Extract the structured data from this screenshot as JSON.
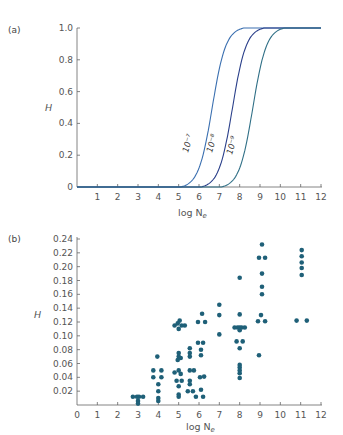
{
  "chart_data": [
    {
      "panel": "(a)",
      "type": "line",
      "xlabel": "log N_e",
      "ylabel": "H",
      "xlim": [
        0,
        12
      ],
      "ylim": [
        0,
        1.0
      ],
      "xticks": [
        "1",
        "2",
        "3",
        "4",
        "5",
        "6",
        "7",
        "8",
        "9",
        "10",
        "11",
        "12"
      ],
      "yticks": [
        "0",
        "0.2",
        "0.4",
        "0.6",
        "0.8",
        "1.0"
      ],
      "grid": false,
      "series": [
        {
          "name": "10⁻⁷",
          "midpoint": 6.9,
          "color": "#3a6fb0",
          "x": [
            0,
            4,
            4.5,
            5,
            5.5,
            6,
            6.5,
            7,
            7.5,
            8,
            8.5,
            9,
            9.5,
            10,
            12
          ],
          "y": [
            0,
            0,
            0.01,
            0.04,
            0.12,
            0.35,
            0.62,
            0.85,
            0.95,
            0.99,
            1.0,
            1.0,
            1.0,
            1.0,
            1.0
          ]
        },
        {
          "name": "10⁻⁸",
          "midpoint": 7.9,
          "color": "#2a3f8a",
          "x": [
            0,
            5,
            5.5,
            6,
            6.5,
            7,
            7.5,
            8,
            8.5,
            9,
            9.5,
            10,
            10.5,
            12
          ],
          "y": [
            0,
            0,
            0.01,
            0.05,
            0.13,
            0.33,
            0.6,
            0.82,
            0.94,
            0.99,
            1.0,
            1.0,
            1.0,
            1.0
          ]
        },
        {
          "name": "10⁻⁹",
          "midpoint": 8.9,
          "color": "#2f6f86",
          "x": [
            0,
            6,
            6.5,
            7,
            7.5,
            8,
            8.5,
            9,
            9.5,
            10,
            10.5,
            11,
            12
          ],
          "y": [
            0,
            0,
            0.01,
            0.05,
            0.14,
            0.35,
            0.62,
            0.84,
            0.95,
            0.99,
            1.0,
            1.0,
            1.0
          ]
        }
      ],
      "annotations": [
        "10⁻⁷",
        "10⁻⁸",
        "10⁻⁹"
      ]
    },
    {
      "panel": "(b)",
      "type": "scatter",
      "xlabel": "log N_e",
      "ylabel": "H",
      "xlim": [
        0,
        12
      ],
      "ylim": [
        0,
        0.24
      ],
      "xticks": [
        "0",
        "1",
        "2",
        "3",
        "4",
        "5",
        "6",
        "7",
        "8",
        "9",
        "10",
        "11",
        "12"
      ],
      "yticks": [
        "0.02",
        "0.04",
        "0.06",
        "0.08",
        "0.10",
        "0.12",
        "0.14",
        "0.16",
        "0.18",
        "0.20",
        "0.22",
        "0.24"
      ],
      "grid": false,
      "color": "#1f6078",
      "points": [
        [
          2.75,
          0.012
        ],
        [
          2.95,
          0.012
        ],
        [
          3.05,
          0.012
        ],
        [
          3.25,
          0.012
        ],
        [
          3.0,
          0.006
        ],
        [
          3.0,
          0.002
        ],
        [
          3.75,
          0.05
        ],
        [
          4.15,
          0.05
        ],
        [
          3.75,
          0.04
        ],
        [
          4.15,
          0.04
        ],
        [
          3.95,
          0.07
        ],
        [
          4.0,
          0.03
        ],
        [
          4.0,
          0.02
        ],
        [
          4.0,
          0.01
        ],
        [
          4.0,
          0.006
        ],
        [
          4.8,
          0.115
        ],
        [
          4.95,
          0.118
        ],
        [
          5.05,
          0.122
        ],
        [
          5.15,
          0.115
        ],
        [
          5.3,
          0.115
        ],
        [
          5.0,
          0.11
        ],
        [
          5.0,
          0.075
        ],
        [
          5.0,
          0.07
        ],
        [
          5.1,
          0.068
        ],
        [
          4.95,
          0.065
        ],
        [
          5.0,
          0.05
        ],
        [
          5.1,
          0.045
        ],
        [
          4.8,
          0.047
        ],
        [
          4.9,
          0.035
        ],
        [
          5.15,
          0.035
        ],
        [
          5.0,
          0.027
        ],
        [
          5.0,
          0.015
        ],
        [
          5.0,
          0.012
        ],
        [
          5.55,
          0.082
        ],
        [
          5.55,
          0.075
        ],
        [
          5.55,
          0.07
        ],
        [
          5.55,
          0.05
        ],
        [
          5.75,
          0.05
        ],
        [
          5.55,
          0.035
        ],
        [
          5.55,
          0.03
        ],
        [
          5.45,
          0.02
        ],
        [
          5.7,
          0.02
        ],
        [
          5.85,
          0.012
        ],
        [
          5.95,
          0.12
        ],
        [
          6.3,
          0.12
        ],
        [
          6.15,
          0.132
        ],
        [
          5.95,
          0.09
        ],
        [
          6.2,
          0.09
        ],
        [
          6.1,
          0.08
        ],
        [
          6.1,
          0.072
        ],
        [
          6.05,
          0.04
        ],
        [
          6.25,
          0.041
        ],
        [
          6.1,
          0.022
        ],
        [
          6.2,
          0.012
        ],
        [
          7.0,
          0.145
        ],
        [
          7.0,
          0.13
        ],
        [
          7.0,
          0.102
        ],
        [
          8.0,
          0.184
        ],
        [
          8.0,
          0.131
        ],
        [
          7.75,
          0.112
        ],
        [
          7.9,
          0.112
        ],
        [
          8.0,
          0.112
        ],
        [
          8.1,
          0.112
        ],
        [
          8.25,
          0.112
        ],
        [
          8.0,
          0.108
        ],
        [
          7.85,
          0.092
        ],
        [
          8.15,
          0.092
        ],
        [
          8.0,
          0.082
        ],
        [
          8.0,
          0.058
        ],
        [
          8.0,
          0.054
        ],
        [
          8.0,
          0.05
        ],
        [
          8.0,
          0.046
        ],
        [
          8.0,
          0.039
        ],
        [
          9.1,
          0.232
        ],
        [
          8.95,
          0.213
        ],
        [
          9.25,
          0.213
        ],
        [
          9.1,
          0.19
        ],
        [
          9.1,
          0.171
        ],
        [
          9.1,
          0.16
        ],
        [
          9.05,
          0.13
        ],
        [
          8.9,
          0.121
        ],
        [
          9.25,
          0.121
        ],
        [
          8.95,
          0.072
        ],
        [
          11.05,
          0.224
        ],
        [
          11.05,
          0.215
        ],
        [
          11.05,
          0.206
        ],
        [
          11.05,
          0.198
        ],
        [
          11.05,
          0.188
        ],
        [
          10.8,
          0.122
        ],
        [
          11.3,
          0.122
        ]
      ]
    }
  ],
  "panels": {
    "a": {
      "label": "(a)",
      "ylabel": "H",
      "xlabel_main": "log N",
      "xlabel_sub": "e",
      "curve_labels": [
        "10⁻⁷",
        "10⁻⁸",
        "10⁻⁹"
      ],
      "xticks": [
        "1",
        "2",
        "3",
        "4",
        "5",
        "6",
        "7",
        "8",
        "9",
        "10",
        "11",
        "12"
      ],
      "yticks": [
        "0",
        "0.2",
        "0.4",
        "0.6",
        "0.8",
        "1.0"
      ]
    },
    "b": {
      "label": "(b)",
      "ylabel": "H",
      "xlabel_main": "log N",
      "xlabel_sub": "e",
      "xticks": [
        "0",
        "1",
        "2",
        "3",
        "4",
        "5",
        "6",
        "7",
        "8",
        "9",
        "10",
        "11",
        "12"
      ],
      "yticks": [
        "0.02",
        "0.04",
        "0.06",
        "0.08",
        "0.10",
        "0.12",
        "0.14",
        "0.16",
        "0.18",
        "0.20",
        "0.22",
        "0.24"
      ]
    }
  }
}
